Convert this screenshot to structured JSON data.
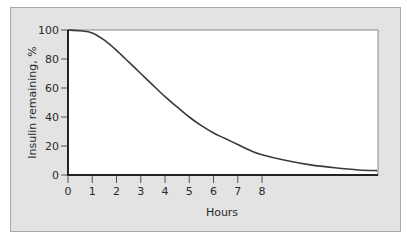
{
  "chart_data": {
    "type": "line",
    "title": "",
    "xlabel": "Hours",
    "ylabel": "Insulin remaining, %",
    "xlim": [
      0,
      12.75
    ],
    "ylim": [
      0,
      100
    ],
    "x_ticks": [
      0,
      1,
      2,
      3,
      4,
      5,
      6,
      7,
      8
    ],
    "x_tick_labels": [
      "0",
      "1",
      "2",
      "3",
      "4",
      "5",
      "6",
      "7",
      "8"
    ],
    "y_ticks": [
      0,
      20,
      40,
      60,
      80,
      100
    ],
    "y_tick_labels": [
      "0",
      "20",
      "40",
      "60",
      "80",
      "100"
    ],
    "grid": false,
    "legend": null,
    "series": [
      {
        "name": "Insulin remaining",
        "x": [
          0,
          0.5,
          1,
          1.5,
          2,
          2.5,
          3,
          3.5,
          4,
          4.5,
          5,
          5.5,
          6,
          6.5,
          7,
          7.5,
          8,
          9,
          10,
          11,
          12,
          12.75
        ],
        "values": [
          100,
          99.5,
          98,
          93,
          86,
          78,
          70,
          62,
          54,
          47,
          40,
          34,
          29,
          25,
          21,
          17,
          14,
          10,
          7,
          5,
          3.5,
          3
        ]
      }
    ],
    "colors": {
      "background": "#e3e3e3",
      "plot_area": "#ffffff",
      "line": "#3a3a3a"
    }
  }
}
